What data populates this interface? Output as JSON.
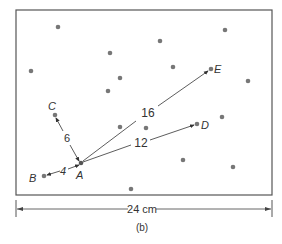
{
  "figure": {
    "caption": "(b)",
    "dimension_label": "24 cm",
    "colors": {
      "frame": "#555555",
      "dot": "#777777",
      "line": "#333333",
      "text": "#333333"
    }
  },
  "points": {
    "scatter": [
      [
        58,
        27
      ],
      [
        31,
        71
      ],
      [
        110,
        53
      ],
      [
        120,
        78
      ],
      [
        108,
        91
      ],
      [
        160,
        41
      ],
      [
        225,
        30
      ],
      [
        248,
        81
      ],
      [
        173,
        67
      ],
      [
        222,
        117
      ],
      [
        120,
        127
      ],
      [
        146,
        128
      ],
      [
        183,
        160
      ],
      [
        233,
        167
      ],
      [
        131,
        189
      ]
    ],
    "labeled": {
      "A": {
        "label": "A",
        "x": 81,
        "y": 163
      },
      "B": {
        "label": "B",
        "x": 44,
        "y": 176
      },
      "C": {
        "label": "C",
        "x": 55,
        "y": 115
      },
      "D": {
        "label": "D",
        "x": 197,
        "y": 124
      },
      "E": {
        "label": "E",
        "x": 211,
        "y": 69
      }
    }
  },
  "distances": {
    "AB": "4",
    "AC": "6",
    "AD": "12",
    "AE": "16"
  }
}
